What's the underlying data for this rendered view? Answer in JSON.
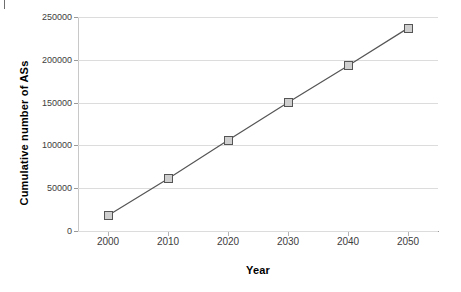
{
  "chart_data": {
    "type": "line",
    "title": "",
    "xlabel": "Year",
    "ylabel": "Cumulative number of ASs",
    "x": [
      2000,
      2010,
      2020,
      2030,
      2040,
      2050
    ],
    "categories": [
      "2000",
      "2010",
      "2020",
      "2030",
      "2040",
      "2050"
    ],
    "values": [
      18000,
      61000,
      106000,
      150000,
      193000,
      237000
    ],
    "series": [
      {
        "name": "Cumulative number of ASs",
        "values": [
          18000,
          61000,
          106000,
          150000,
          193000,
          237000
        ]
      }
    ],
    "xlim": [
      1995,
      2055
    ],
    "ylim": [
      0,
      250000
    ],
    "ytick_labels": [
      "0",
      "50000",
      "100000",
      "150000",
      "200000",
      "250000"
    ],
    "ytick_values": [
      0,
      50000,
      100000,
      150000,
      200000,
      250000
    ],
    "xtick_labels": [
      "2000",
      "2010",
      "2020",
      "2030",
      "2040",
      "2050"
    ],
    "xtick_values": [
      2000,
      2010,
      2020,
      2030,
      2040,
      2050
    ],
    "grid": "horizontal",
    "legend": "none",
    "marker": "square",
    "colors": {
      "line": "#555555",
      "marker_fill": "#cfcfcf",
      "marker_edge": "#555555",
      "gridline": "#dcdcdc",
      "axis": "#9a9a9a",
      "text": "#000000",
      "tick_text": "#3d3d3d",
      "background": "#ffffff"
    }
  }
}
